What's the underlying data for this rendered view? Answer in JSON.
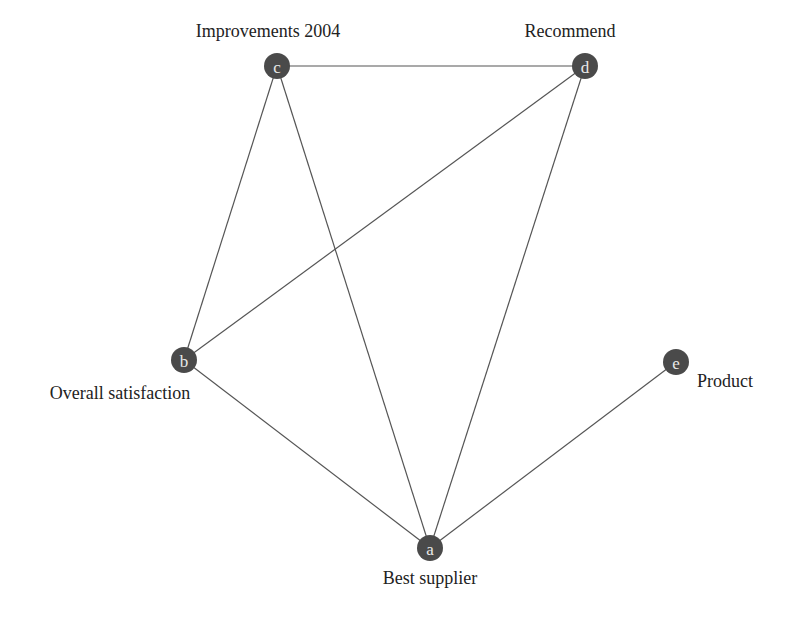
{
  "diagram": {
    "type": "network-graph",
    "node_color": "#4a4a4a",
    "edge_color": "#555555",
    "nodes": [
      {
        "id": "a",
        "letter": "a",
        "label": "Best supplier",
        "x": 430,
        "y": 548,
        "label_x": 430,
        "label_y": 584,
        "anchor": "middle"
      },
      {
        "id": "b",
        "letter": "b",
        "label": "Overall satisfaction",
        "x": 184,
        "y": 360,
        "label_x": 120,
        "label_y": 399,
        "anchor": "middle"
      },
      {
        "id": "c",
        "letter": "c",
        "label": "Improvements 2004",
        "x": 277,
        "y": 66,
        "label_x": 268,
        "label_y": 37,
        "anchor": "middle"
      },
      {
        "id": "d",
        "letter": "d",
        "label": "Recommend",
        "x": 585,
        "y": 66,
        "label_x": 570,
        "label_y": 37,
        "anchor": "middle"
      },
      {
        "id": "e",
        "letter": "e",
        "label": "Product",
        "x": 676,
        "y": 362,
        "label_x": 697,
        "label_y": 387,
        "anchor": "start"
      }
    ],
    "edges": [
      {
        "from": "c",
        "to": "d"
      },
      {
        "from": "c",
        "to": "b"
      },
      {
        "from": "c",
        "to": "a"
      },
      {
        "from": "d",
        "to": "b"
      },
      {
        "from": "d",
        "to": "a"
      },
      {
        "from": "b",
        "to": "a"
      },
      {
        "from": "e",
        "to": "a"
      }
    ]
  }
}
